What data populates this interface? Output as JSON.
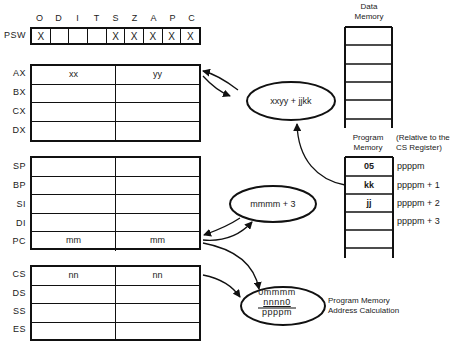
{
  "psw": {
    "label": "PSW",
    "flags": [
      {
        "name": "O",
        "value": "X"
      },
      {
        "name": "D",
        "value": ""
      },
      {
        "name": "I",
        "value": ""
      },
      {
        "name": "T",
        "value": ""
      },
      {
        "name": "S",
        "value": "X"
      },
      {
        "name": "Z",
        "value": "X"
      },
      {
        "name": "A",
        "value": "X"
      },
      {
        "name": "P",
        "value": "X"
      },
      {
        "name": "C",
        "value": "X"
      }
    ]
  },
  "general_registers": [
    {
      "name": "AX",
      "high": "xx",
      "low": "yy"
    },
    {
      "name": "BX",
      "high": "",
      "low": ""
    },
    {
      "name": "CX",
      "high": "",
      "low": ""
    },
    {
      "name": "DX",
      "high": "",
      "low": ""
    }
  ],
  "pointer_registers": [
    {
      "name": "SP",
      "high": "",
      "low": ""
    },
    {
      "name": "BP",
      "high": "",
      "low": ""
    },
    {
      "name": "SI",
      "high": "",
      "low": ""
    },
    {
      "name": "DI",
      "high": "",
      "low": ""
    },
    {
      "name": "PC",
      "high": "mm",
      "low": "mm"
    }
  ],
  "segment_registers": [
    {
      "name": "CS",
      "high": "nn",
      "low": "nn"
    },
    {
      "name": "DS",
      "high": "",
      "low": ""
    },
    {
      "name": "SS",
      "high": "",
      "low": ""
    },
    {
      "name": "ES",
      "high": "",
      "low": ""
    }
  ],
  "data_memory": {
    "title_line1": "Data",
    "title_line2": "Memory"
  },
  "program_memory": {
    "title_line1": "Program",
    "title_line2": "Memory",
    "note_line1": "(Relative to the",
    "note_line2": "CS Register)",
    "cells": [
      {
        "value": "05",
        "address": "ppppm"
      },
      {
        "value": "kk",
        "address": "ppppm + 1"
      },
      {
        "value": "jj",
        "address": "ppppm + 2"
      },
      {
        "value": "",
        "address": "ppppm + 3"
      },
      {
        "value": "",
        "address": ""
      }
    ]
  },
  "operations": {
    "add_op": "xxyy + jjkk",
    "pc_increment": "mmmm + 3",
    "address_calc": {
      "line1": "0mmmm",
      "line2": "nnnn0",
      "result": "ppppm",
      "caption_line1": "Program Memory",
      "caption_line2": "Address Calculation"
    }
  },
  "colors": {
    "ink": "#111111",
    "background": "#ffffff"
  }
}
